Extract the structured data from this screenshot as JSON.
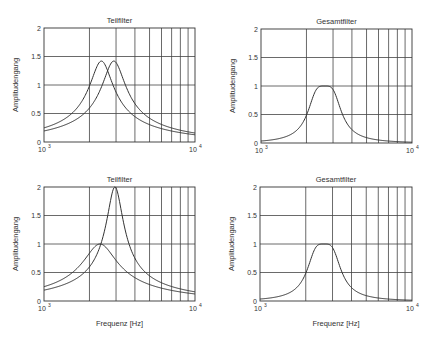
{
  "chart_data": [
    {
      "type": "line",
      "title": "Teilfilter",
      "xlabel": "",
      "ylabel": "Amplitudengang",
      "xscale": "log",
      "xlim": [
        1000,
        10000
      ],
      "ylim": [
        0,
        2
      ],
      "yticks": [
        "0",
        "0.5",
        "1",
        "1.5",
        "2"
      ],
      "xticks": [
        "10^3",
        "10^4"
      ],
      "grid": true,
      "series": [
        {
          "name": "Filter 1",
          "f0": 2400,
          "peak": 1.42,
          "q": 1.42
        },
        {
          "name": "Filter 2",
          "f0": 2900,
          "peak": 1.42,
          "q": 1.42
        }
      ]
    },
    {
      "type": "line",
      "title": "Gesamtfilter",
      "xlabel": "",
      "ylabel": "Amplitudengang",
      "xscale": "log",
      "xlim": [
        1000,
        10000
      ],
      "ylim": [
        0,
        2
      ],
      "yticks": [
        "0",
        "0.5",
        "1",
        "1.5",
        "2"
      ],
      "xticks": [
        "10^3",
        "10^4"
      ],
      "grid": true,
      "series": [
        {
          "name": "Gesamt",
          "f0": 2640,
          "peak": 1.0,
          "flat": true
        }
      ]
    },
    {
      "type": "line",
      "title": "Teilfilter",
      "xlabel": "Frequenz [Hz]",
      "ylabel": "Amplitudengang",
      "xscale": "log",
      "xlim": [
        1000,
        10000
      ],
      "ylim": [
        0,
        2
      ],
      "yticks": [
        "0",
        "0.5",
        "1",
        "1.5",
        "2"
      ],
      "xticks": [
        "10^3",
        "10^4"
      ],
      "grid": true,
      "series": [
        {
          "name": "Filter 1",
          "f0": 2350,
          "peak": 1.0,
          "q": 1.0
        },
        {
          "name": "Filter 2",
          "f0": 2950,
          "peak": 2.0,
          "q": 2.0
        }
      ]
    },
    {
      "type": "line",
      "title": "Gesamtfilter",
      "xlabel": "Frequenz [Hz]",
      "ylabel": "Amplitudengang",
      "xscale": "log",
      "xlim": [
        1000,
        10000
      ],
      "ylim": [
        0,
        2
      ],
      "yticks": [
        "0",
        "0.5",
        "1",
        "1.5",
        "2"
      ],
      "xticks": [
        "10^3",
        "10^4"
      ],
      "grid": true,
      "series": [
        {
          "name": "Gesamt",
          "f0": 2640,
          "peak": 1.0,
          "flat": true
        }
      ]
    }
  ],
  "panels": [
    {
      "title": "Teilfilter",
      "ylabel": "Amplitudengang",
      "xlabel": "",
      "x_min_label": "10",
      "x_min_exp": "3",
      "x_max_label": "10",
      "x_max_exp": "4"
    },
    {
      "title": "Gesamtfilter",
      "ylabel": "Amplitudengang",
      "xlabel": "",
      "x_min_label": "10",
      "x_min_exp": "3",
      "x_max_label": "10",
      "x_max_exp": "4"
    },
    {
      "title": "Teilfilter",
      "ylabel": "Amplitudengang",
      "xlabel": "Frequenz [Hz]",
      "x_min_label": "10",
      "x_min_exp": "3",
      "x_max_label": "10",
      "x_max_exp": "4"
    },
    {
      "title": "Gesamtfilter",
      "ylabel": "Amplitudengang",
      "xlabel": "Frequenz [Hz]",
      "x_min_label": "10",
      "x_min_exp": "3",
      "x_max_label": "10",
      "x_max_exp": "4"
    }
  ],
  "yticks": [
    "0",
    "0.5",
    "1",
    "1.5",
    "2"
  ],
  "colors": {
    "line": "#333333",
    "grid": "#444444",
    "axis": "#333333"
  }
}
